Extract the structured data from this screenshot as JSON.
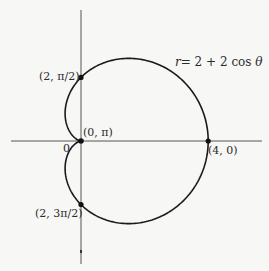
{
  "figure": {
    "equation": {
      "lhs": "r",
      "rhs": "= 2 + 2 cos ",
      "theta": "θ"
    },
    "pole_label": "0",
    "points": [
      {
        "id": "top",
        "label": "(2, π/2)",
        "r": 2,
        "theta_text": "π/2"
      },
      {
        "id": "pole",
        "label": "(0, π)",
        "r": 0,
        "theta_text": "π"
      },
      {
        "id": "right",
        "label": "(4, 0)",
        "r": 4,
        "theta_text": "0"
      },
      {
        "id": "bottom",
        "label": "(2, 3π/2)",
        "r": 2,
        "theta_text": "3π/2"
      }
    ],
    "colors": {
      "background": "#f7f7f5",
      "curve": "#1a1a1a",
      "axis": "#555555",
      "text": "#2a2a2a"
    }
  },
  "chart_data": {
    "type": "line",
    "coordinate_system": "polar",
    "function": "r = 2 + 2cos(theta)",
    "curve_name": "cardioid",
    "x": [
      0,
      0.5236,
      1.0472,
      1.5708,
      2.0944,
      2.618,
      3.1416,
      3.6652,
      4.1888,
      4.7124,
      5.236,
      5.7596,
      6.2832
    ],
    "series": [
      {
        "name": "r",
        "values": [
          4,
          3.732,
          3,
          2,
          1,
          0.268,
          0,
          0.268,
          1,
          2,
          3,
          3.732,
          4
        ]
      }
    ],
    "labeled_points": [
      {
        "label": "(2, π/2)",
        "r": 2,
        "theta": 1.5708
      },
      {
        "label": "(0, π)",
        "r": 0,
        "theta": 3.1416
      },
      {
        "label": "(4, 0)",
        "r": 4,
        "theta": 0
      },
      {
        "label": "(2, 3π/2)",
        "r": 2,
        "theta": 4.7124
      }
    ],
    "xlabel": "",
    "ylabel": "",
    "annotations": [
      "r = 2 + 2 cos θ",
      "0"
    ],
    "grid": false,
    "legend": "none"
  }
}
